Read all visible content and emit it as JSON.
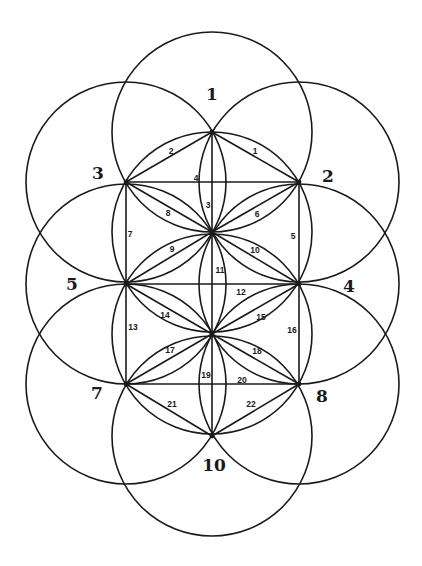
{
  "diagram": {
    "type": "circle-graph",
    "circle_radius": 100,
    "circles": [
      {
        "id": "1",
        "cx": 212,
        "cy": 132,
        "label": "1",
        "lx": 212,
        "ly": 100
      },
      {
        "id": "2",
        "cx": 299,
        "cy": 182,
        "label": "2",
        "lx": 328,
        "ly": 182
      },
      {
        "id": "3",
        "cx": 126,
        "cy": 182,
        "label": "3",
        "lx": 98,
        "ly": 179
      },
      {
        "id": "4",
        "cx": 299,
        "cy": 284,
        "label": "4",
        "lx": 349,
        "ly": 292
      },
      {
        "id": "5",
        "cx": 126,
        "cy": 284,
        "label": "5",
        "lx": 72,
        "ly": 290
      },
      {
        "id": "7",
        "cx": 126,
        "cy": 384,
        "label": "7",
        "lx": 97,
        "ly": 399
      },
      {
        "id": "8",
        "cx": 299,
        "cy": 384,
        "label": "8",
        "lx": 322,
        "ly": 402
      },
      {
        "id": "10",
        "cx": 212,
        "cy": 436,
        "label": "10",
        "lx": 214,
        "ly": 471
      },
      {
        "id": "c-upper",
        "cx": 212,
        "cy": 232,
        "label": "",
        "lx": 0,
        "ly": 0
      },
      {
        "id": "c-lower",
        "cx": 212,
        "cy": 334,
        "label": "",
        "lx": 0,
        "ly": 0
      }
    ],
    "vertices": {
      "A": [
        212,
        132
      ],
      "B": [
        126,
        182
      ],
      "C": [
        299,
        182
      ],
      "D": [
        212,
        232
      ],
      "E": [
        126,
        284
      ],
      "F": [
        299,
        284
      ],
      "G": [
        212,
        334
      ],
      "H": [
        126,
        384
      ],
      "I": [
        299,
        384
      ],
      "J": [
        212,
        436
      ]
    },
    "edges": [
      {
        "label": "1",
        "from": "A",
        "to": "C",
        "lx": 255,
        "ly": 154
      },
      {
        "label": "2",
        "from": "A",
        "to": "B",
        "lx": 171,
        "ly": 154
      },
      {
        "label": "3",
        "from": "A",
        "to": "D",
        "lx": 208,
        "ly": 208
      },
      {
        "label": "4",
        "from": "B",
        "to": "C",
        "lx": 196,
        "ly": 181
      },
      {
        "label": "5",
        "from": "C",
        "to": "F",
        "lx": 293,
        "ly": 239
      },
      {
        "label": "6",
        "from": "C",
        "to": "D",
        "lx": 257,
        "ly": 217
      },
      {
        "label": "7",
        "from": "B",
        "to": "E",
        "lx": 130,
        "ly": 237
      },
      {
        "label": "8",
        "from": "B",
        "to": "D",
        "lx": 168,
        "ly": 216
      },
      {
        "label": "9",
        "from": "D",
        "to": "E",
        "lx": 172,
        "ly": 252
      },
      {
        "label": "10",
        "from": "D",
        "to": "F",
        "lx": 255,
        "ly": 253
      },
      {
        "label": "11",
        "from": "D",
        "to": "G",
        "lx": 220,
        "ly": 273
      },
      {
        "label": "12",
        "from": "E",
        "to": "F",
        "lx": 241,
        "ly": 295
      },
      {
        "label": "13",
        "from": "E",
        "to": "H",
        "lx": 133,
        "ly": 330
      },
      {
        "label": "14",
        "from": "E",
        "to": "G",
        "lx": 165,
        "ly": 318
      },
      {
        "label": "15",
        "from": "F",
        "to": "G",
        "lx": 261,
        "ly": 320
      },
      {
        "label": "16",
        "from": "F",
        "to": "I",
        "lx": 292,
        "ly": 333
      },
      {
        "label": "17",
        "from": "G",
        "to": "H",
        "lx": 170,
        "ly": 353
      },
      {
        "label": "18",
        "from": "G",
        "to": "I",
        "lx": 257,
        "ly": 354
      },
      {
        "label": "19",
        "from": "G",
        "to": "J",
        "lx": 206,
        "ly": 378
      },
      {
        "label": "20",
        "from": "H",
        "to": "I",
        "lx": 242,
        "ly": 383
      },
      {
        "label": "21",
        "from": "H",
        "to": "J",
        "lx": 172,
        "ly": 407
      },
      {
        "label": "22",
        "from": "I",
        "to": "J",
        "lx": 251,
        "ly": 407
      }
    ]
  }
}
